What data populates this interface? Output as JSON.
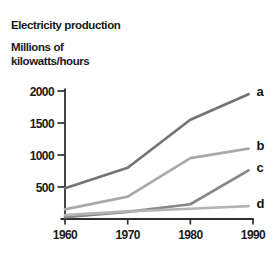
{
  "header": {
    "title": "Electricity production",
    "unit_line1": "Millions of",
    "unit_line2": "kilowatts/hours"
  },
  "chart_data": {
    "type": "line",
    "title": "Electricity production",
    "ylabel": "Millions of kilowatts/hours",
    "xlabel": "",
    "x": [
      1960,
      1970,
      1980,
      1990
    ],
    "xticks": [
      "1960",
      "1970",
      "1980",
      "1990"
    ],
    "yticks": [
      500,
      1000,
      1500,
      2000
    ],
    "ylim": [
      0,
      2000
    ],
    "grid": false,
    "legend_position": "line-end-labels-right",
    "axis_color": "#303030",
    "label_color": "#1b1b1b",
    "series": [
      {
        "name": "a",
        "values": [
          480,
          800,
          1550,
          1950
        ],
        "color": "#717376"
      },
      {
        "name": "b",
        "values": [
          150,
          350,
          950,
          1100
        ],
        "color": "#a7a9ac"
      },
      {
        "name": "c",
        "values": [
          30,
          110,
          230,
          760
        ],
        "color": "#85878a"
      },
      {
        "name": "d",
        "values": [
          60,
          120,
          160,
          200
        ],
        "color": "#b2b4b6"
      }
    ]
  }
}
